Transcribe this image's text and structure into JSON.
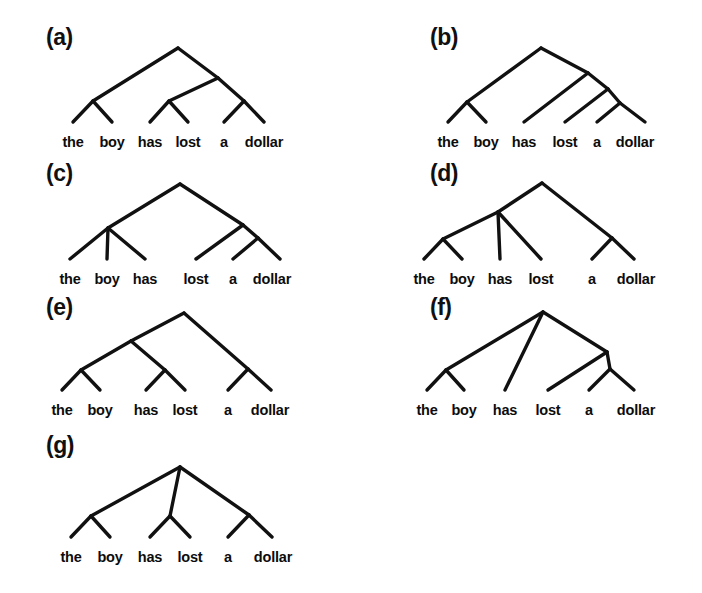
{
  "figure": {
    "sentence": "the boy has lost a dollar",
    "words": [
      "the",
      "boy",
      "has",
      "lost",
      "a",
      "dollar"
    ],
    "line_color": "#111111",
    "text_color": "#0c0c0c",
    "background_color": "#ffffff"
  },
  "panels": [
    {
      "label": "(a)",
      "label_x": 46,
      "label_y": 24,
      "origin_x": 0,
      "origin_y": 0,
      "leaf_y": 134,
      "leaves": [
        {
          "word": "the",
          "x": 73
        },
        {
          "word": "boy",
          "x": 112
        },
        {
          "word": "has",
          "x": 150
        },
        {
          "word": "lost",
          "x": 188
        },
        {
          "word": "a",
          "x": 224
        },
        {
          "word": "dollar",
          "x": 264
        }
      ],
      "edges": [
        {
          "x1": 73,
          "y1": 122,
          "x2": 93,
          "y2": 101
        },
        {
          "x1": 93,
          "y1": 101,
          "x2": 112,
          "y2": 122
        },
        {
          "x1": 93,
          "y1": 101,
          "x2": 178,
          "y2": 48
        },
        {
          "x1": 150,
          "y1": 122,
          "x2": 169,
          "y2": 101
        },
        {
          "x1": 169,
          "y1": 101,
          "x2": 188,
          "y2": 122
        },
        {
          "x1": 169,
          "y1": 101,
          "x2": 218,
          "y2": 78
        },
        {
          "x1": 224,
          "y1": 122,
          "x2": 244,
          "y2": 101
        },
        {
          "x1": 244,
          "y1": 101,
          "x2": 264,
          "y2": 122
        },
        {
          "x1": 244,
          "y1": 101,
          "x2": 218,
          "y2": 78
        },
        {
          "x1": 218,
          "y1": 78,
          "x2": 178,
          "y2": 48
        }
      ]
    },
    {
      "label": "(b)",
      "label_x": 430,
      "label_y": 24,
      "origin_x": 0,
      "origin_y": 0,
      "leaf_y": 134,
      "leaves": [
        {
          "word": "the",
          "x": 448
        },
        {
          "word": "boy",
          "x": 486
        },
        {
          "word": "has",
          "x": 524
        },
        {
          "word": "lost",
          "x": 565
        },
        {
          "word": "a",
          "x": 597
        },
        {
          "word": "dollar",
          "x": 635
        }
      ],
      "edges": [
        {
          "x1": 448,
          "y1": 122,
          "x2": 467,
          "y2": 102
        },
        {
          "x1": 467,
          "y1": 102,
          "x2": 486,
          "y2": 122
        },
        {
          "x1": 467,
          "y1": 102,
          "x2": 541,
          "y2": 48
        },
        {
          "x1": 524,
          "y1": 122,
          "x2": 588,
          "y2": 73
        },
        {
          "x1": 588,
          "y1": 73,
          "x2": 541,
          "y2": 48
        },
        {
          "x1": 565,
          "y1": 122,
          "x2": 608,
          "y2": 89
        },
        {
          "x1": 608,
          "y1": 89,
          "x2": 588,
          "y2": 73
        },
        {
          "x1": 597,
          "y1": 122,
          "x2": 620,
          "y2": 103
        },
        {
          "x1": 620,
          "y1": 103,
          "x2": 645,
          "y2": 122
        },
        {
          "x1": 620,
          "y1": 103,
          "x2": 608,
          "y2": 89
        }
      ]
    },
    {
      "label": "(c)",
      "label_x": 46,
      "label_y": 160,
      "origin_x": 0,
      "origin_y": 0,
      "leaf_y": 271,
      "leaves": [
        {
          "word": "the",
          "x": 70
        },
        {
          "word": "boy",
          "x": 107
        },
        {
          "word": "has",
          "x": 145
        },
        {
          "word": "lost",
          "x": 196
        },
        {
          "word": "a",
          "x": 233
        },
        {
          "word": "dollar",
          "x": 272
        }
      ],
      "edges": [
        {
          "x1": 70,
          "y1": 259,
          "x2": 108,
          "y2": 228
        },
        {
          "x1": 108,
          "y1": 228,
          "x2": 107,
          "y2": 259
        },
        {
          "x1": 108,
          "y1": 228,
          "x2": 145,
          "y2": 259
        },
        {
          "x1": 108,
          "y1": 228,
          "x2": 180,
          "y2": 184
        },
        {
          "x1": 196,
          "y1": 259,
          "x2": 243,
          "y2": 225
        },
        {
          "x1": 243,
          "y1": 225,
          "x2": 180,
          "y2": 184
        },
        {
          "x1": 233,
          "y1": 259,
          "x2": 258,
          "y2": 238
        },
        {
          "x1": 258,
          "y1": 238,
          "x2": 280,
          "y2": 259
        },
        {
          "x1": 258,
          "y1": 238,
          "x2": 243,
          "y2": 225
        }
      ]
    },
    {
      "label": "(d)",
      "label_x": 430,
      "label_y": 160,
      "origin_x": 0,
      "origin_y": 0,
      "leaf_y": 271,
      "leaves": [
        {
          "word": "the",
          "x": 424
        },
        {
          "word": "boy",
          "x": 462
        },
        {
          "word": "has",
          "x": 500
        },
        {
          "word": "lost",
          "x": 541
        },
        {
          "word": "a",
          "x": 592
        },
        {
          "word": "dollar",
          "x": 636
        }
      ],
      "edges": [
        {
          "x1": 424,
          "y1": 259,
          "x2": 443,
          "y2": 239
        },
        {
          "x1": 443,
          "y1": 239,
          "x2": 462,
          "y2": 259
        },
        {
          "x1": 443,
          "y1": 239,
          "x2": 498,
          "y2": 212
        },
        {
          "x1": 500,
          "y1": 259,
          "x2": 498,
          "y2": 212
        },
        {
          "x1": 541,
          "y1": 259,
          "x2": 498,
          "y2": 212
        },
        {
          "x1": 498,
          "y1": 212,
          "x2": 542,
          "y2": 183
        },
        {
          "x1": 592,
          "y1": 259,
          "x2": 612,
          "y2": 238
        },
        {
          "x1": 612,
          "y1": 238,
          "x2": 634,
          "y2": 259
        },
        {
          "x1": 612,
          "y1": 238,
          "x2": 542,
          "y2": 183
        }
      ]
    },
    {
      "label": "(e)",
      "label_x": 46,
      "label_y": 294,
      "origin_x": 0,
      "origin_y": 0,
      "leaf_y": 402,
      "leaves": [
        {
          "word": "the",
          "x": 62
        },
        {
          "word": "boy",
          "x": 100
        },
        {
          "word": "has",
          "x": 146
        },
        {
          "word": "lost",
          "x": 185
        },
        {
          "word": "a",
          "x": 228
        },
        {
          "word": "dollar",
          "x": 270
        }
      ],
      "edges": [
        {
          "x1": 62,
          "y1": 390,
          "x2": 81,
          "y2": 370
        },
        {
          "x1": 81,
          "y1": 370,
          "x2": 100,
          "y2": 390
        },
        {
          "x1": 81,
          "y1": 370,
          "x2": 131,
          "y2": 341
        },
        {
          "x1": 146,
          "y1": 390,
          "x2": 165,
          "y2": 370
        },
        {
          "x1": 165,
          "y1": 370,
          "x2": 185,
          "y2": 390
        },
        {
          "x1": 165,
          "y1": 370,
          "x2": 131,
          "y2": 341
        },
        {
          "x1": 131,
          "y1": 341,
          "x2": 184,
          "y2": 313
        },
        {
          "x1": 228,
          "y1": 390,
          "x2": 248,
          "y2": 369
        },
        {
          "x1": 248,
          "y1": 369,
          "x2": 271,
          "y2": 390
        },
        {
          "x1": 248,
          "y1": 369,
          "x2": 184,
          "y2": 313
        }
      ]
    },
    {
      "label": "(f)",
      "label_x": 430,
      "label_y": 294,
      "origin_x": 0,
      "origin_y": 0,
      "leaf_y": 402,
      "leaves": [
        {
          "word": "the",
          "x": 427
        },
        {
          "word": "boy",
          "x": 464
        },
        {
          "word": "has",
          "x": 505
        },
        {
          "word": "lost",
          "x": 548
        },
        {
          "word": "a",
          "x": 589
        },
        {
          "word": "dollar",
          "x": 636
        }
      ],
      "edges": [
        {
          "x1": 427,
          "y1": 390,
          "x2": 446,
          "y2": 370
        },
        {
          "x1": 446,
          "y1": 370,
          "x2": 464,
          "y2": 390
        },
        {
          "x1": 446,
          "y1": 370,
          "x2": 543,
          "y2": 312
        },
        {
          "x1": 505,
          "y1": 390,
          "x2": 543,
          "y2": 312
        },
        {
          "x1": 543,
          "y1": 312,
          "x2": 607,
          "y2": 352
        },
        {
          "x1": 548,
          "y1": 390,
          "x2": 607,
          "y2": 352
        },
        {
          "x1": 589,
          "y1": 390,
          "x2": 610,
          "y2": 369
        },
        {
          "x1": 610,
          "y1": 369,
          "x2": 634,
          "y2": 390
        },
        {
          "x1": 610,
          "y1": 369,
          "x2": 607,
          "y2": 352
        }
      ]
    },
    {
      "label": "(g)",
      "label_x": 46,
      "label_y": 432,
      "origin_x": 0,
      "origin_y": 0,
      "leaf_y": 549,
      "leaves": [
        {
          "word": "the",
          "x": 71
        },
        {
          "word": "boy",
          "x": 110
        },
        {
          "word": "has",
          "x": 150
        },
        {
          "word": "lost",
          "x": 190
        },
        {
          "word": "a",
          "x": 228
        },
        {
          "word": "dollar",
          "x": 273
        }
      ],
      "edges": [
        {
          "x1": 71,
          "y1": 537,
          "x2": 91,
          "y2": 516
        },
        {
          "x1": 91,
          "y1": 516,
          "x2": 110,
          "y2": 537
        },
        {
          "x1": 91,
          "y1": 516,
          "x2": 180,
          "y2": 467
        },
        {
          "x1": 150,
          "y1": 537,
          "x2": 170,
          "y2": 516
        },
        {
          "x1": 170,
          "y1": 516,
          "x2": 190,
          "y2": 537
        },
        {
          "x1": 170,
          "y1": 516,
          "x2": 180,
          "y2": 467
        },
        {
          "x1": 228,
          "y1": 537,
          "x2": 249,
          "y2": 515
        },
        {
          "x1": 249,
          "y1": 515,
          "x2": 272,
          "y2": 537
        },
        {
          "x1": 249,
          "y1": 515,
          "x2": 180,
          "y2": 467
        }
      ]
    }
  ]
}
